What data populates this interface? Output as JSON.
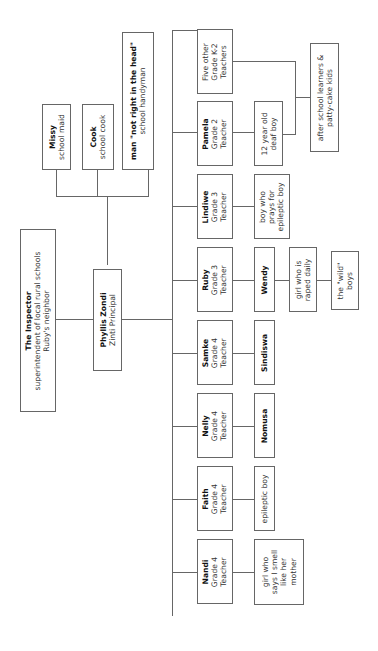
{
  "diagram": {
    "type": "org-chart",
    "orientation": "rotated-90-ccw",
    "line_color": "#666666",
    "nodes": {
      "inspector": {
        "title": "The Inspector",
        "lines": [
          "superintendent of local rural schools",
          "Ruby's neighbor"
        ]
      },
      "principal": {
        "title": "Phyllis Zondi",
        "lines": [
          "Zinti Principal"
        ]
      },
      "missy": {
        "title": "Missy",
        "lines": [
          "school maid"
        ]
      },
      "cook": {
        "title": "Cook",
        "lines": [
          "school cook"
        ]
      },
      "handyman": {
        "title": "man \"not right in the head\"",
        "lines": [
          "school handyman"
        ]
      },
      "k2": {
        "title": "",
        "lines": [
          "Five other",
          "Grade K-2",
          "Teachers"
        ]
      },
      "pamela": {
        "title": "Pamela",
        "lines": [
          "Grade 2",
          "Teacher"
        ]
      },
      "lindiwe": {
        "title": "Lindiwe",
        "lines": [
          "Grade 3",
          "Teacher"
        ]
      },
      "ruby": {
        "title": "Ruby",
        "lines": [
          "Grade 3",
          "Teacher"
        ]
      },
      "samke": {
        "title": "Samke",
        "lines": [
          "Grade 4",
          "Teacher"
        ]
      },
      "nelly": {
        "title": "Nelly",
        "lines": [
          "Grade 4",
          "Teacher"
        ]
      },
      "faith": {
        "title": "Faith",
        "lines": [
          "Grade 4",
          "Teacher"
        ]
      },
      "nandi": {
        "title": "Nandi",
        "lines": [
          "Grade 4",
          "Teacher"
        ]
      },
      "deafboy": {
        "title": "",
        "lines": [
          "12 year old",
          "deaf boy"
        ]
      },
      "afterschool": {
        "title": "",
        "lines": [
          "after school learners &",
          "patty-cake kids"
        ]
      },
      "prayboy": {
        "title": "",
        "lines": [
          "boy who",
          "prays for",
          "epileptic boy"
        ]
      },
      "wendy": {
        "title": "Wendy",
        "lines": []
      },
      "girlraped": {
        "title": "",
        "lines": [
          "girl who is",
          "raped daily"
        ]
      },
      "wildboys": {
        "title": "",
        "lines": [
          "the \"wild\"",
          "boys"
        ]
      },
      "sindiswa": {
        "title": "Sindiswa",
        "lines": []
      },
      "nomusa": {
        "title": "Nomusa",
        "lines": []
      },
      "epilepticboy": {
        "title": "",
        "lines": [
          "epileptic boy"
        ]
      },
      "girlsmell": {
        "title": "",
        "lines": [
          "girl who",
          "says I smell",
          "like her",
          "mother"
        ]
      }
    },
    "edges": [
      [
        "inspector",
        "principal"
      ],
      [
        "principal",
        "missy"
      ],
      [
        "principal",
        "cook"
      ],
      [
        "principal",
        "handyman"
      ],
      [
        "principal",
        "k2"
      ],
      [
        "principal",
        "pamela"
      ],
      [
        "principal",
        "lindiwe"
      ],
      [
        "principal",
        "ruby"
      ],
      [
        "principal",
        "samke"
      ],
      [
        "principal",
        "nelly"
      ],
      [
        "principal",
        "faith"
      ],
      [
        "principal",
        "nandi"
      ],
      [
        "pamela",
        "deafboy"
      ],
      [
        "k2",
        "afterschool"
      ],
      [
        "deafboy",
        "afterschool"
      ],
      [
        "lindiwe",
        "prayboy"
      ],
      [
        "ruby",
        "wendy"
      ],
      [
        "wendy",
        "girlraped"
      ],
      [
        "girlraped",
        "wildboys"
      ],
      [
        "samke",
        "sindiswa"
      ],
      [
        "nelly",
        "nomusa"
      ],
      [
        "faith",
        "epilepticboy"
      ],
      [
        "nandi",
        "girlsmell"
      ]
    ]
  }
}
